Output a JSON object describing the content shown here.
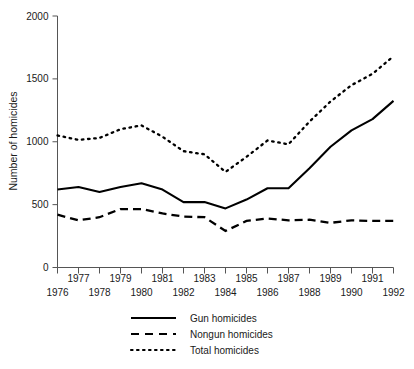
{
  "chart_data": {
    "type": "line",
    "title": "",
    "xlabel": "",
    "ylabel": "Number of homicides",
    "xlim": [
      1976,
      1992
    ],
    "ylim": [
      0,
      2000
    ],
    "grid": false,
    "legend_position": "bottom",
    "y_ticks": [
      0,
      500,
      1000,
      1500,
      2000
    ],
    "y_tick_labels": [
      "0",
      "500",
      "1000",
      "1500",
      "2000"
    ],
    "x": [
      1976,
      1977,
      1978,
      1979,
      1980,
      1981,
      1982,
      1983,
      1984,
      1985,
      1986,
      1987,
      1988,
      1989,
      1990,
      1991,
      1992
    ],
    "x_tick_labels": [
      "1976",
      "1977",
      "1978",
      "1979",
      "1980",
      "1981",
      "1982",
      "1983",
      "1984",
      "1985",
      "1986",
      "1987",
      "1988",
      "1989",
      "1990",
      "1991",
      "1992"
    ],
    "series": [
      {
        "name": "Gun homicides",
        "style": "solid",
        "values": [
          620,
          640,
          600,
          640,
          670,
          620,
          520,
          520,
          470,
          540,
          630,
          630,
          790,
          960,
          1090,
          1180,
          1325
        ]
      },
      {
        "name": "Nongun homicides",
        "style": "dashed",
        "values": [
          420,
          375,
          400,
          465,
          465,
          430,
          405,
          400,
          290,
          370,
          390,
          375,
          380,
          355,
          375,
          370,
          370
        ]
      },
      {
        "name": "Total homicides",
        "style": "dotted",
        "values": [
          1050,
          1015,
          1030,
          1100,
          1130,
          1040,
          925,
          900,
          760,
          880,
          1010,
          980,
          1160,
          1320,
          1450,
          1540,
          1680
        ]
      }
    ]
  },
  "legend": {
    "entries": [
      {
        "label": "Gun homicides",
        "style": "solid"
      },
      {
        "label": "Nongun homicides",
        "style": "dashed"
      },
      {
        "label": "Total homicides",
        "style": "dotted"
      }
    ]
  },
  "axes": {
    "y_title": "Number of homicides"
  }
}
